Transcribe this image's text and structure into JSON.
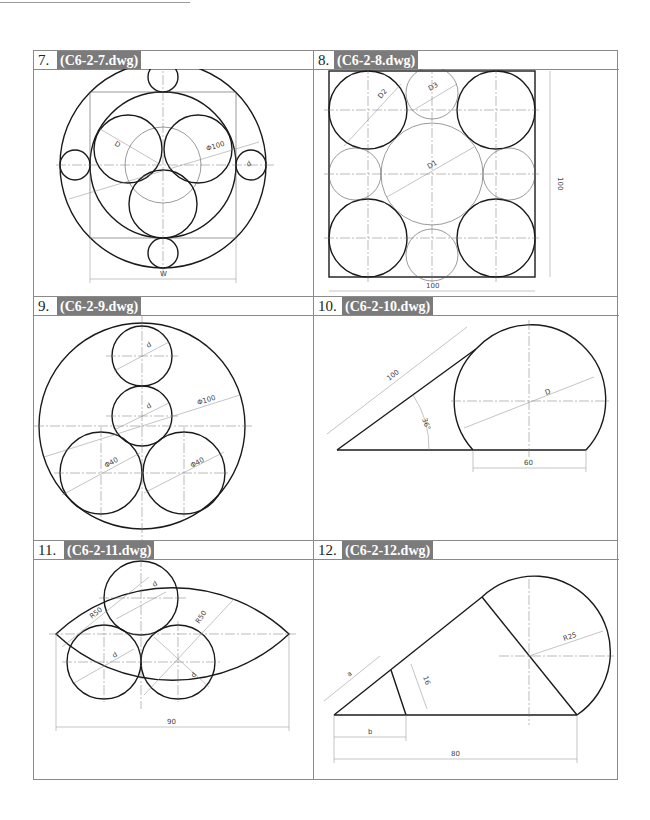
{
  "page": {
    "exercises": [
      {
        "number": "7.",
        "file": "(C6-2-7.dwg)",
        "dimensions": [
          "D",
          "Φ100",
          "d",
          "W"
        ]
      },
      {
        "number": "8.",
        "file": "(C6-2-8.dwg)",
        "dimensions": [
          "D2",
          "D3",
          "D1",
          "100",
          "100"
        ]
      },
      {
        "number": "9.",
        "file": "(C6-2-9.dwg)",
        "dimensions": [
          "d",
          "d",
          "Φ100",
          "Φ40",
          "Φ40"
        ]
      },
      {
        "number": "10.",
        "file": "(C6-2-10.dwg)",
        "dimensions": [
          "100",
          "36°",
          "D",
          "60"
        ]
      },
      {
        "number": "11.",
        "file": "(C6-2-11.dwg)",
        "dimensions": [
          "R50",
          "R50",
          "d",
          "d",
          "d",
          "90"
        ]
      },
      {
        "number": "12.",
        "file": "(C6-2-12.dwg)",
        "dimensions": [
          "a",
          "16",
          "b",
          "R25",
          "80"
        ]
      }
    ]
  },
  "colors": {
    "tag_background": "#7b7b7b",
    "tag_text": "#ffffff",
    "grid_line": "#8a8a8a",
    "drawing_line": "#1a1a1a"
  }
}
